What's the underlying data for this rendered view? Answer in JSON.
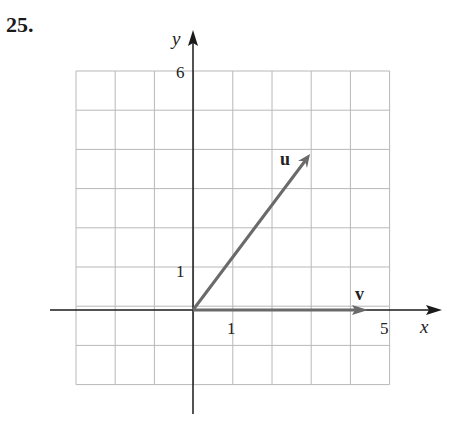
{
  "problem": {
    "number": "25."
  },
  "colors": {
    "grid": "#b8b8b8",
    "axis": "#1a1a1a",
    "vector": "#6a6a6a",
    "text": "#222222"
  },
  "chart_data": {
    "type": "vector-plot",
    "title": "",
    "xlabel": "x",
    "ylabel": "y",
    "xlim": [
      -3,
      5
    ],
    "ylim": [
      -2,
      6
    ],
    "grid": true,
    "grid_step": 1,
    "tick_labels": {
      "x": [
        "1",
        "5"
      ],
      "y": [
        "1",
        "6"
      ]
    },
    "vectors": [
      {
        "name": "u",
        "from": [
          0,
          0
        ],
        "to": [
          3,
          4
        ]
      },
      {
        "name": "v",
        "from": [
          0,
          0
        ],
        "to": [
          4.5,
          0
        ]
      }
    ]
  },
  "labels": {
    "xaxis": "x",
    "yaxis": "y",
    "tick_x1": "1",
    "tick_x5": "5",
    "tick_y1": "1",
    "tick_y6": "6",
    "vec_u": "u",
    "vec_v": "v"
  }
}
